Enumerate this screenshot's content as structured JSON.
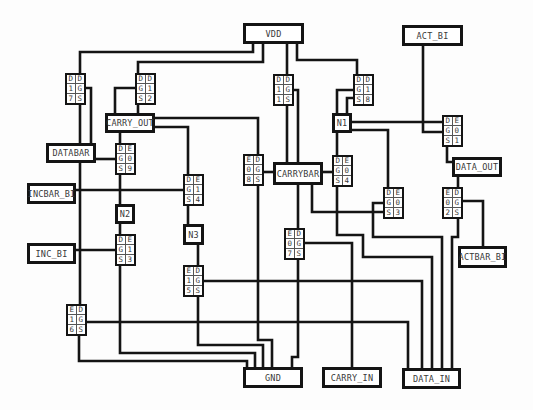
{
  "nodes": {
    "vdd": "VDD",
    "act_bi": "ACT_BI",
    "carry_out": "CARRY_OUT",
    "n1": "N1",
    "databar": "DATABAR",
    "carrybar": "CARRYBAR",
    "data_out": "DATA_OUT",
    "incbar_bi": "INCBAR_BI",
    "n2": "N2",
    "n3": "N3",
    "inc_bi": "INC_BI",
    "actbar_bi": "ACTBAR_BI",
    "gnd": "GND",
    "carry_in": "CARRY_IN",
    "data_in": "DATA_IN"
  },
  "transistors": [
    {
      "id": "t17",
      "cells": [
        "D",
        "D",
        "1",
        "G",
        "7",
        "S"
      ]
    },
    {
      "id": "t12",
      "cells": [
        "D",
        "D",
        "G",
        "1",
        "S",
        "2"
      ]
    },
    {
      "id": "t15a",
      "cells": [
        "D",
        "D",
        "1",
        "G",
        "1",
        "S"
      ]
    },
    {
      "id": "t18",
      "cells": [
        "D",
        "D",
        "G",
        "1",
        "S",
        "8"
      ]
    },
    {
      "id": "t01",
      "cells": [
        "D",
        "E",
        "G",
        "0",
        "S",
        "1"
      ]
    },
    {
      "id": "t09",
      "cells": [
        "D",
        "E",
        "G",
        "0",
        "S",
        "9"
      ]
    },
    {
      "id": "t08",
      "cells": [
        "E",
        "D",
        "0",
        "G",
        "8",
        "S"
      ]
    },
    {
      "id": "t04",
      "cells": [
        "D",
        "E",
        "G",
        "0",
        "S",
        "4"
      ]
    },
    {
      "id": "t14",
      "cells": [
        "D",
        "E",
        "G",
        "1",
        "S",
        "4"
      ]
    },
    {
      "id": "t03",
      "cells": [
        "D",
        "E",
        "G",
        "0",
        "S",
        "3"
      ]
    },
    {
      "id": "t02",
      "cells": [
        "E",
        "D",
        "0",
        "G",
        "2",
        "S"
      ]
    },
    {
      "id": "t07",
      "cells": [
        "E",
        "D",
        "0",
        "G",
        "7",
        "S"
      ]
    },
    {
      "id": "t13",
      "cells": [
        "D",
        "E",
        "G",
        "1",
        "S",
        "3"
      ]
    },
    {
      "id": "t15b",
      "cells": [
        "E",
        "D",
        "1",
        "G",
        "5",
        "S"
      ]
    },
    {
      "id": "t16",
      "cells": [
        "E",
        "D",
        "1",
        "G",
        "6",
        "S"
      ]
    }
  ]
}
